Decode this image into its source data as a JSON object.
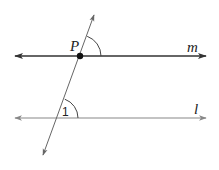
{
  "diagram": {
    "type": "parallel-lines-transversal",
    "lines": [
      {
        "name": "m",
        "label": "m",
        "y": 56,
        "x1": 15,
        "x2": 206,
        "color": "#333333",
        "width": 1.3
      },
      {
        "name": "l",
        "label": "l",
        "y": 118,
        "x1": 15,
        "x2": 206,
        "color": "#888888",
        "width": 1.1
      }
    ],
    "transversal": {
      "x1": 94,
      "y1": 15,
      "x2": 43,
      "y2": 155,
      "color": "#666666"
    },
    "point": {
      "label": "P",
      "x": 80,
      "y": 56
    },
    "angles": [
      {
        "name": "angle-at-P",
        "label": "",
        "cx": 80,
        "cy": 56,
        "r": 21
      },
      {
        "name": "angle-1",
        "label": "1",
        "cx": 58,
        "cy": 118,
        "r": 20
      }
    ]
  },
  "labels": {
    "point_p": "P",
    "line_m": "m",
    "line_l": "l",
    "angle_1": "1"
  }
}
